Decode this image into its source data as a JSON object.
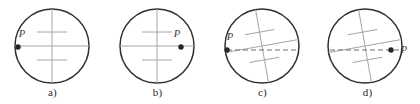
{
  "figure": {
    "type": "diagram",
    "width": 420,
    "height": 104,
    "background_color": "#ffffff",
    "outline_color": "#2f2f2f",
    "grid_color": "#a6a6a6",
    "dashed_color": "#6f6f6f",
    "dot_color": "#262626",
    "label_color": "#3a3a3a",
    "caption_color": "#2b2b2b",
    "point_label": "P"
  },
  "panels": [
    {
      "id": "panel-a",
      "caption": "a)",
      "left": 0,
      "center_x": 52,
      "center_y": 46,
      "radius": 37,
      "grid_tilt_deg": 0,
      "point_label": "P",
      "point_x": 18,
      "point_y": 47,
      "label_x": 22,
      "label_y": 37,
      "dashed_line": false
    },
    {
      "id": "panel-b",
      "caption": "b)",
      "left": 105,
      "center_x": 52,
      "center_y": 46,
      "radius": 37,
      "grid_tilt_deg": 0,
      "point_label": "P",
      "point_x": 76,
      "point_y": 47,
      "label_x": 72,
      "label_y": 37,
      "dashed_line": false
    },
    {
      "id": "panel-c",
      "caption": "c)",
      "left": 210,
      "center_x": 52,
      "center_y": 46,
      "radius": 37,
      "grid_tilt_deg": -10,
      "point_label": "P",
      "point_x": 17,
      "point_y": 50,
      "label_x": 20,
      "label_y": 40,
      "dashed_line": true
    },
    {
      "id": "panel-d",
      "caption": "d)",
      "left": 315,
      "center_x": 50,
      "center_y": 46,
      "radius": 37,
      "grid_tilt_deg": -10,
      "point_label": "P",
      "point_x": 76,
      "point_y": 50,
      "label_x": 89,
      "label_y": 53,
      "dashed_line": true
    }
  ],
  "captions": {
    "a": "a)",
    "b": "b)",
    "c": "c)",
    "d": "d)"
  }
}
